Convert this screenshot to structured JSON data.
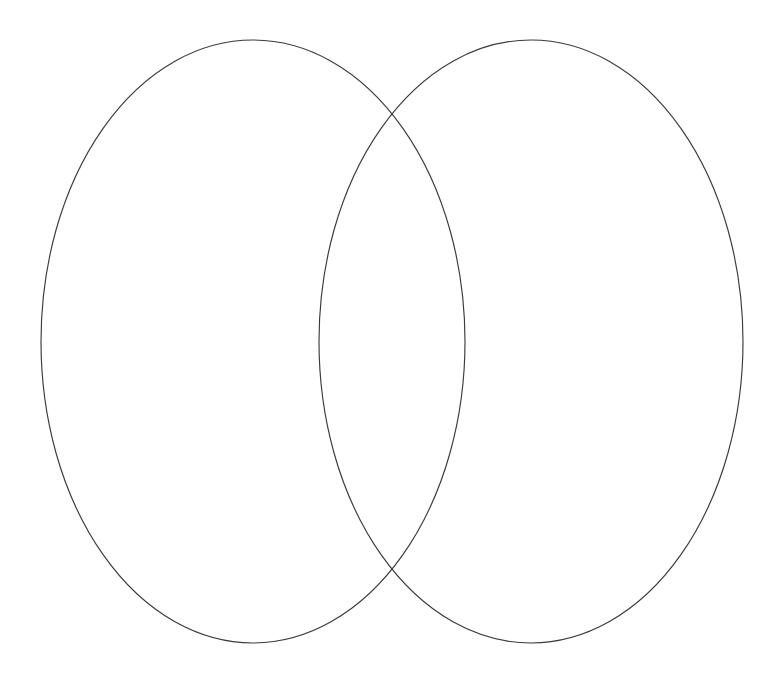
{
  "canvas": {
    "width": 778,
    "height": 673,
    "background_color": "#ffffff"
  },
  "diagram": {
    "type": "venn",
    "set_count": 2,
    "title": "",
    "labels_present": false,
    "stroke_color": "#3a3a3a",
    "stroke_width": 1.15,
    "fill_color": "none",
    "left_set_label": "",
    "right_set_label": "",
    "intersection_label": "",
    "left_only_label": "",
    "right_only_label": "",
    "shapes": [
      {
        "name": "left-ellipse",
        "cx": 253,
        "cy": 341.5,
        "rx": 212,
        "ry": 301.5,
        "stroke": "#3a3a3a",
        "fill": "none"
      },
      {
        "name": "right-ellipse",
        "cx": 531,
        "cy": 341.5,
        "rx": 212,
        "ry": 301.5,
        "stroke": "#3a3a3a",
        "fill": "none"
      }
    ],
    "intersection_points": [
      {
        "name": "upper-crossing",
        "x": 395,
        "y": 113
      },
      {
        "name": "lower-crossing",
        "x": 395,
        "y": 570
      }
    ],
    "extents": {
      "left_edge_x": 41,
      "right_edge_x": 743,
      "top_edge_y": 40,
      "bottom_edge_y": 643,
      "left_ellipse_right_x": 465,
      "right_ellipse_left_x": 319
    }
  },
  "chart_data": {
    "type": "diagram",
    "subtype": "venn-2-set",
    "title": "",
    "categories": [
      "Left set",
      "Right set",
      "Intersection"
    ],
    "values": [
      null,
      null,
      null
    ],
    "series": [
      {
        "name": "Left set",
        "label": "",
        "count": null
      },
      {
        "name": "Right set",
        "label": "",
        "count": null
      },
      {
        "name": "Intersection",
        "label": "",
        "count": null
      }
    ],
    "annotations": [],
    "legend": [],
    "grid": false,
    "note": "Blank two-circle Venn diagram template; no text, numbers or fills are rendered."
  }
}
